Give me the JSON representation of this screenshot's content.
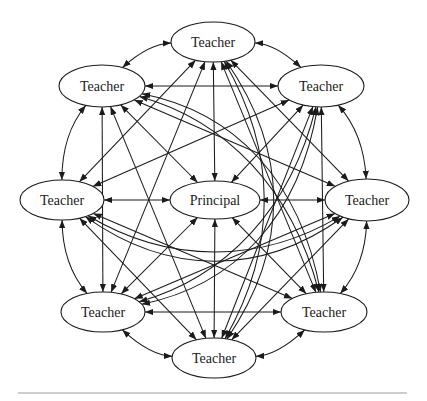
{
  "canvas": {
    "width": 427,
    "height": 401,
    "background": "#ffffff"
  },
  "styles": {
    "edge_color": "#1b1b1b",
    "node_stroke": "#1b1b1b",
    "node_fill": "#ffffff",
    "label_color": "#1a1a1a",
    "rule_color": "#9b9b9b",
    "font_size": 14
  },
  "diagram": {
    "type": "directed-network",
    "nodes": [
      {
        "id": "principal",
        "label": "Principal",
        "x": 215,
        "y": 200,
        "rx": 45,
        "ry": 19
      },
      {
        "id": "t0",
        "label": "Teacher",
        "x": 213,
        "y": 42,
        "rx": 42,
        "ry": 20
      },
      {
        "id": "t1",
        "label": "Teacher",
        "x": 321,
        "y": 86,
        "rx": 43,
        "ry": 21
      },
      {
        "id": "t2",
        "label": "Teacher",
        "x": 367,
        "y": 200,
        "rx": 42,
        "ry": 21
      },
      {
        "id": "t3",
        "label": "Teacher",
        "x": 324,
        "y": 312,
        "rx": 43,
        "ry": 20
      },
      {
        "id": "t4",
        "label": "Teacher",
        "x": 214,
        "y": 358,
        "rx": 42,
        "ry": 20
      },
      {
        "id": "t5",
        "label": "Teacher",
        "x": 103,
        "y": 312,
        "rx": 42,
        "ry": 20
      },
      {
        "id": "t6",
        "label": "Teacher",
        "x": 62,
        "y": 200,
        "rx": 42,
        "ry": 20
      },
      {
        "id": "t7",
        "label": "Teacher",
        "x": 102,
        "y": 86,
        "rx": 43,
        "ry": 21
      }
    ],
    "ring_order": [
      "t0",
      "t1",
      "t2",
      "t3",
      "t4",
      "t5",
      "t6",
      "t7"
    ],
    "edges": {
      "complete_graph": true,
      "bidirectional": true,
      "arrow_style": "filled-triangle"
    }
  },
  "footer": {
    "has_bottom_rule": true
  }
}
